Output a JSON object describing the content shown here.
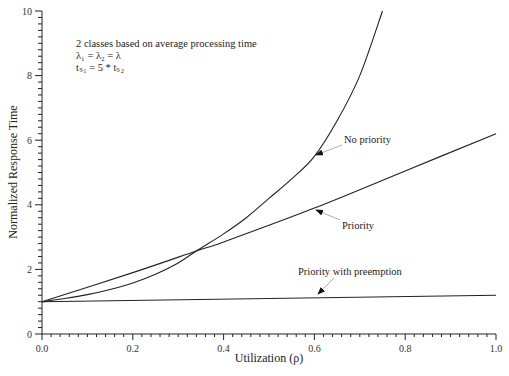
{
  "chart_data": {
    "type": "line",
    "title": "",
    "xlabel": "Utilization (ρ)",
    "ylabel": "Normalized Response Time",
    "xlim": [
      0,
      1.0
    ],
    "ylim": [
      0,
      10
    ],
    "grid": false,
    "xticks": [
      "0.0",
      "0.2",
      "0.4",
      "0.6",
      "0.8",
      "1.0"
    ],
    "yticks": [
      "0",
      "2",
      "4",
      "6",
      "8",
      "10"
    ],
    "x_minor_step": 0.02,
    "y_minor_step": 0.2,
    "annotation_text": [
      "2 classes based on average processing time",
      "λ₁ = λ₂ = λ",
      "tₛ₁ = 5 * tₛ₂"
    ],
    "series": [
      {
        "name": "No priority",
        "x": [
          0,
          0.05,
          0.1,
          0.15,
          0.2,
          0.25,
          0.3,
          0.34,
          0.4,
          0.45,
          0.5,
          0.55,
          0.6,
          0.65,
          0.7,
          0.75
        ],
        "y": [
          1.0,
          1.1,
          1.22,
          1.38,
          1.58,
          1.85,
          2.2,
          2.57,
          3.1,
          3.6,
          4.2,
          4.8,
          5.5,
          6.6,
          8.0,
          10.0
        ],
        "label_at": 0.6
      },
      {
        "name": "Priority",
        "x": [
          0,
          0.2,
          0.34,
          0.4,
          0.6,
          0.8,
          1.0
        ],
        "y": [
          1.0,
          1.9,
          2.57,
          2.85,
          3.9,
          5.05,
          6.2
        ],
        "label_at": 0.6
      },
      {
        "name": "Priority with preemption",
        "x": [
          0,
          1.0
        ],
        "y": [
          1.0,
          1.2
        ],
        "label_at": 0.6
      }
    ]
  }
}
